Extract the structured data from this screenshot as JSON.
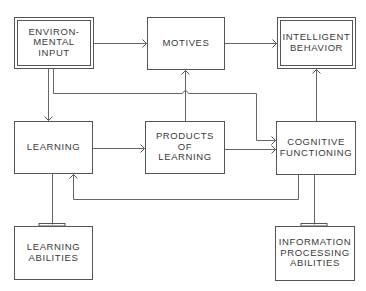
{
  "diagram": {
    "nodes": [
      {
        "id": "environmental_input",
        "lines": [
          "ENVIRON-",
          "MENTAL",
          "INPUT"
        ],
        "style": "double"
      },
      {
        "id": "motives",
        "lines": [
          "MOTIVES"
        ],
        "style": "single"
      },
      {
        "id": "intelligent_behavior",
        "lines": [
          "INTELLIGENT",
          "BEHAVIOR"
        ],
        "style": "double"
      },
      {
        "id": "learning",
        "lines": [
          "LEARNING"
        ],
        "style": "single"
      },
      {
        "id": "products_of_learning",
        "lines": [
          "PRODUCTS",
          "OF",
          "LEARNING"
        ],
        "style": "single"
      },
      {
        "id": "cognitive_functioning",
        "lines": [
          "COGNITIVE",
          "FUNCTIONING"
        ],
        "style": "single"
      },
      {
        "id": "learning_abilities",
        "lines": [
          "LEARNING",
          "ABILITIES"
        ],
        "style": "tabbed"
      },
      {
        "id": "information_processing_abilities",
        "lines": [
          "INFORMATION",
          "PROCESSING",
          "ABILITIES"
        ],
        "style": "tabbed"
      }
    ],
    "edges": [
      {
        "from": "environmental_input",
        "to": "motives",
        "type": "arrow"
      },
      {
        "from": "motives",
        "to": "intelligent_behavior",
        "type": "arrow"
      },
      {
        "from": "environmental_input",
        "to": "learning",
        "type": "arrow"
      },
      {
        "from": "environmental_input",
        "to": "cognitive_functioning",
        "type": "arrow"
      },
      {
        "from": "learning",
        "to": "products_of_learning",
        "type": "arrow"
      },
      {
        "from": "products_of_learning",
        "to": "motives",
        "type": "arrow"
      },
      {
        "from": "products_of_learning",
        "to": "cognitive_functioning",
        "type": "arrow"
      },
      {
        "from": "cognitive_functioning",
        "to": "intelligent_behavior",
        "type": "arrow"
      },
      {
        "from": "cognitive_functioning",
        "to": "learning",
        "type": "arrow"
      },
      {
        "from": "learning_abilities",
        "to": "learning",
        "type": "connector"
      },
      {
        "from": "information_processing_abilities",
        "to": "cognitive_functioning",
        "type": "connector"
      }
    ]
  }
}
